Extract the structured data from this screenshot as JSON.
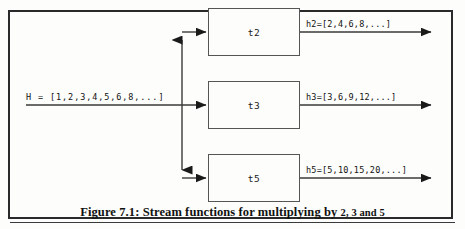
{
  "figure": {
    "caption_prefix": "Figure 7.1:",
    "caption_text": "Stream functions for multiplying by",
    "caption_numbers": "2, 3 and 5",
    "caption_full": "Figure 7.1: Stream functions for multiplying by 2, 3 and 5"
  },
  "input": {
    "label": "H =  [1,2,3,4,5,6,8,...]"
  },
  "nodes": [
    {
      "id": "t2",
      "label": "t2"
    },
    {
      "id": "t3",
      "label": "t3"
    },
    {
      "id": "t5",
      "label": "t5"
    }
  ],
  "outputs": [
    {
      "id": "h2",
      "label": "h2=[2,4,6,8,...]"
    },
    {
      "id": "h3",
      "label": "h3=[3,6,9,12,...]"
    },
    {
      "id": "h5",
      "label": "h5=[5,10,15,20,...]"
    }
  ],
  "colors": {
    "frame": "#2a2a2a",
    "box_border": "#555555",
    "line": "#3a3a3a",
    "text": "#111111",
    "background": "#fdfdfb"
  }
}
